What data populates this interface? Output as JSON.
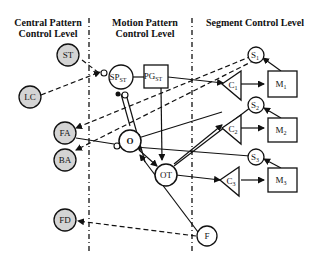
{
  "diagram": {
    "columns": [
      {
        "id": "central",
        "line1": "Central Pattern",
        "line2": "Control Level"
      },
      {
        "id": "motion",
        "line1": "Motion Pattern",
        "line2": "Control Level"
      },
      {
        "id": "segment",
        "line1": "Segment Control Level",
        "line2": ""
      }
    ],
    "nodes": {
      "ST": {
        "label": "ST",
        "shape": "circle",
        "shaded": true
      },
      "LC": {
        "label": "LC",
        "shape": "circle",
        "shaded": true
      },
      "FA": {
        "label": "FA",
        "shape": "circle",
        "shaded": true
      },
      "BA": {
        "label": "BA",
        "shape": "circle",
        "shaded": true
      },
      "FD": {
        "label": "FD",
        "shape": "circle",
        "shaded": true
      },
      "SP": {
        "label": "SP",
        "sub": "ST",
        "shape": "circle"
      },
      "PG": {
        "label": "PG",
        "sub": "ST",
        "shape": "rect"
      },
      "O": {
        "label": "O",
        "shape": "circle"
      },
      "OT": {
        "label": "OT",
        "shape": "circle"
      },
      "F": {
        "label": "F",
        "shape": "circle"
      },
      "S1": {
        "label": "S",
        "sub": "1",
        "shape": "circle"
      },
      "S2": {
        "label": "S",
        "sub": "2",
        "shape": "circle"
      },
      "S3": {
        "label": "S",
        "sub": "3",
        "shape": "circle"
      },
      "C1": {
        "label": "C",
        "sub": "1",
        "shape": "triangle"
      },
      "C2": {
        "label": "C",
        "sub": "2",
        "shape": "triangle"
      },
      "C3": {
        "label": "C",
        "sub": "3",
        "shape": "triangle"
      },
      "M1": {
        "label": "M",
        "sub": "1",
        "shape": "rect"
      },
      "M2": {
        "label": "M",
        "sub": "2",
        "shape": "rect"
      },
      "M3": {
        "label": "M",
        "sub": "3",
        "shape": "rect"
      }
    },
    "colors": {
      "shaded_fill": "#d4d4d4",
      "stroke": "#111111",
      "background": "#ffffff"
    }
  }
}
